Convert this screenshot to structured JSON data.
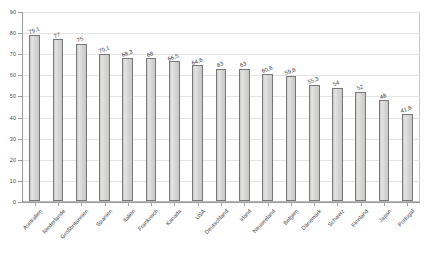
{
  "chart_data": {
    "type": "bar",
    "title": "",
    "subtitle": "",
    "xlabel": "",
    "ylabel": "",
    "ylim": [
      0,
      90
    ],
    "ytick_step": 10,
    "yticks": [
      "0",
      "10",
      "20",
      "30",
      "40",
      "50",
      "60",
      "70",
      "80",
      "90"
    ],
    "grid": true,
    "grid_axis": "y",
    "legend": false,
    "legend_position": "none",
    "orientation": "vertical",
    "categories": [
      "Australien",
      "Niederlande",
      "Großbritannien",
      "Spanien",
      "Italien",
      "Frankreich",
      "Kanada",
      "USA",
      "Deutschland",
      "Irland",
      "Neuseeland",
      "Belgien",
      "Dänemark",
      "Schweiz",
      "Finnland",
      "Japan",
      "Portugal"
    ],
    "values": [
      79.1,
      77,
      75,
      70.1,
      68.3,
      68,
      66.5,
      64.6,
      63,
      63,
      60.6,
      59.6,
      55.3,
      54,
      52,
      48,
      41.6
    ],
    "value_labels": [
      "79,1",
      "77",
      "75",
      "70,1",
      "68,3",
      "68",
      "66,5",
      "64,6",
      "63",
      "63",
      "60,6",
      "59,6",
      "55,3",
      "54",
      "52",
      "48",
      "41,6"
    ],
    "series": [
      {
        "name": "",
        "values": [
          79.1,
          77,
          75,
          70.1,
          68.3,
          68,
          66.5,
          64.6,
          63,
          63,
          60.6,
          59.6,
          55.3,
          54,
          52,
          48,
          41.6
        ]
      }
    ],
    "colors": {
      "bar_fill": "#d9d9d7",
      "bar_border": "#77777a",
      "gridline": "#e4e4e4",
      "axis": "#9a9a9a",
      "plot_border": "#b9b9b9",
      "text": "#3d3d3d",
      "background": "#ffffff"
    }
  }
}
